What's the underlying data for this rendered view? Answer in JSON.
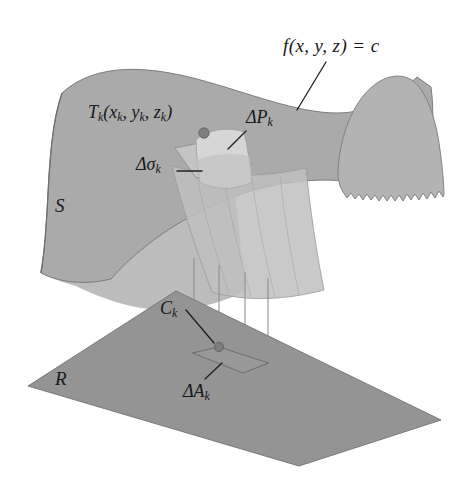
{
  "figure": {
    "domain": "mathematical-diagram",
    "background_color": "#ffffff",
    "ink_color": "#17181a"
  },
  "labels": {
    "equation": {
      "text": "f(x, y, z) = c",
      "parts": {
        "fn": "f",
        "args": "(x, y, z)",
        "eq": "=",
        "value": "c"
      }
    },
    "tangent_point": {
      "text": "Tk(xk, yk, zk)",
      "base": "T",
      "sub": "k",
      "args": [
        "x",
        "y",
        "z"
      ],
      "arg_sub": "k"
    },
    "delta_p": {
      "text": "ΔPk",
      "delta": "Δ",
      "base": "P",
      "sub": "k"
    },
    "delta_sigma": {
      "text": "Δσk",
      "delta": "Δ",
      "base": "σ",
      "sub": "k"
    },
    "surface_s": {
      "text": "S"
    },
    "c_k": {
      "text": "Ck",
      "base": "C",
      "sub": "k"
    },
    "delta_a": {
      "text": "ΔAk",
      "delta": "Δ",
      "base": "A",
      "sub": "k"
    },
    "region_r": {
      "text": "R"
    }
  },
  "colors": {
    "surface_upper_band": "#a9a9a9",
    "surface_lower_sheet": "#b9b9b9",
    "surface_fold": "#b3b3b3",
    "patch_delta_p": "#d2d2d2",
    "patch_delta_sigma": "#c4c4c4",
    "plane_region_r": "#939393",
    "outline": "#6f6f6f",
    "leader_line": "#2a2a2a",
    "marker_dot": "#7a7a7a",
    "background": "#ffffff"
  },
  "elements": {
    "level_surface": {
      "name": "S",
      "description": "saddle-shaped level surface f(x,y,z)=c"
    },
    "planar_region": {
      "name": "R",
      "description": "shaded parallelogram region in the xy-plane"
    },
    "surface_patch": {
      "name": "ΔPk",
      "description": "curved patch of surface area"
    },
    "tangent_patch": {
      "name": "Δσk",
      "description": "tangent plane parallelogram approximating ΔPk"
    },
    "projection_lines": {
      "count": 4,
      "description": "vertical lines projecting patch corners onto R"
    },
    "base_patch": {
      "name": "ΔAk",
      "description": "projected area element in R"
    },
    "markers": [
      {
        "name": "tangent-point-dot",
        "x": 204,
        "y": 133
      },
      {
        "name": "c-k-dot",
        "x": 219,
        "y": 347
      }
    ]
  }
}
